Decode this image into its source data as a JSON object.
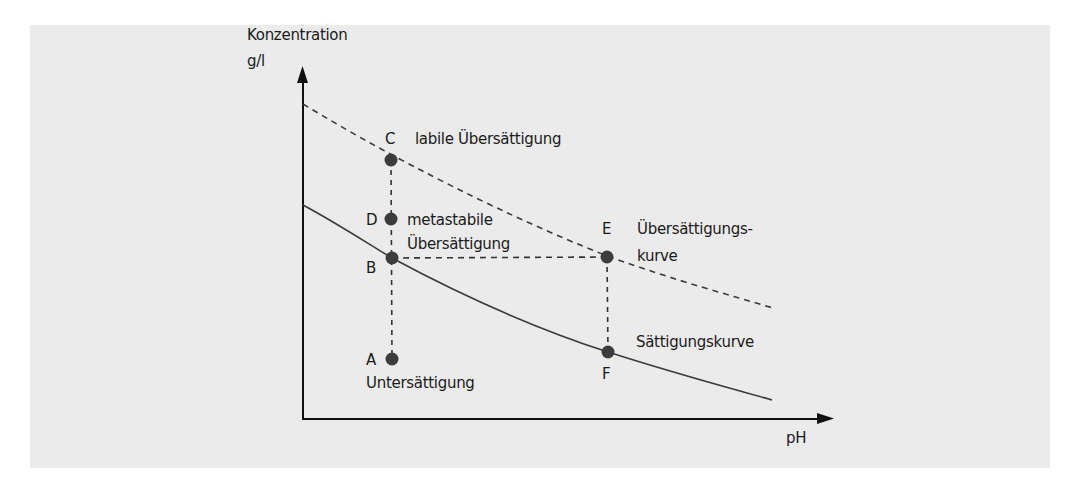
{
  "diagram": {
    "title": "",
    "y_axis": {
      "label": "Konzentration",
      "unit": "g/l"
    },
    "x_axis": {
      "label": "pH"
    },
    "curves": {
      "supersaturation": {
        "label_line1": "Übersättigungs-",
        "label_line2": "kurve",
        "style": "dashed"
      },
      "saturation": {
        "label": "Sättigungskurve",
        "style": "solid"
      }
    },
    "points": {
      "A": {
        "letter": "A",
        "description": "Untersättigung"
      },
      "B": {
        "letter": "B",
        "description": ""
      },
      "C": {
        "letter": "C",
        "description": "labile Übersättigung"
      },
      "D": {
        "letter": "D",
        "description_line1": "metastabile",
        "description_line2": "Übersättigung"
      },
      "E": {
        "letter": "E",
        "description": ""
      },
      "F": {
        "letter": "F",
        "description": ""
      }
    },
    "colors": {
      "panel_background": "#ebebeb",
      "ink": "#1a1a1a",
      "curve": "#3a3a3a",
      "point": "#3c3c3c"
    }
  }
}
